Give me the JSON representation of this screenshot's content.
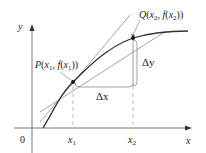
{
  "diagram": {
    "type": "secant-and-tangent-lines",
    "axes": {
      "x_label": "x",
      "y_label": "y",
      "origin_label": "0"
    },
    "ticks": {
      "x1": "x",
      "x1_sub": "1",
      "x2": "x",
      "x2_sub": "2"
    },
    "points": {
      "P": {
        "name": "P",
        "open": "(",
        "x": "x",
        "x_sub": "1",
        "sep": ", ",
        "fx": "f",
        "fopen": "(",
        "fx_var": "x",
        "fx_sub": "1",
        "close": "))"
      },
      "Q": {
        "name": "Q",
        "open": "(",
        "x": "x",
        "x_sub": "2",
        "sep": ", ",
        "fx": "f",
        "fopen": "(",
        "fx_var": "x",
        "fx_sub": "2",
        "close": "))"
      }
    },
    "increments": {
      "dx": "Δx",
      "dy": "Δy"
    },
    "colors": {
      "curve": "#333333",
      "lines": "#888888",
      "axes": "#666666",
      "bracket": "#999999",
      "points": "#111111"
    }
  }
}
